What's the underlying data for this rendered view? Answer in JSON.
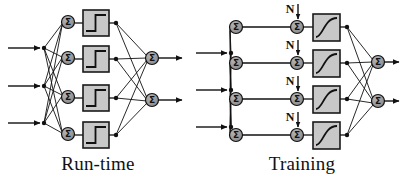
{
  "figure": {
    "background_color": "#ffffff",
    "stroke_color": "#111111",
    "node_fill_color": "#9a9a9a",
    "box_fill_color": "#c8c8c8",
    "box_border_color": "#1a1a1a"
  },
  "panels": [
    {
      "id": "run-time",
      "caption": "Run-time",
      "caption_x": 98,
      "caption_y": 170,
      "activation": "step",
      "has_noise_injection": false,
      "inputs": [
        {
          "label": "",
          "y": 48
        },
        {
          "label": "",
          "y": 86
        },
        {
          "label": "",
          "y": 123
        }
      ],
      "hidden_nodes": [
        {
          "symbol": "Σ",
          "x": 68,
          "y": 22
        },
        {
          "symbol": "Σ",
          "x": 68,
          "y": 58
        },
        {
          "symbol": "Σ",
          "x": 68,
          "y": 97
        },
        {
          "symbol": "Σ",
          "x": 68,
          "y": 134
        }
      ],
      "activation_boxes": [
        {
          "x": 83,
          "y": 10,
          "w": 26,
          "h": 26,
          "shape": "step"
        },
        {
          "x": 83,
          "y": 46,
          "w": 26,
          "h": 26,
          "shape": "step"
        },
        {
          "x": 83,
          "y": 85,
          "w": 26,
          "h": 26,
          "shape": "step"
        },
        {
          "x": 83,
          "y": 122,
          "w": 26,
          "h": 26,
          "shape": "step"
        }
      ],
      "output_nodes": [
        {
          "symbol": "Σ",
          "x": 152,
          "y": 58
        },
        {
          "symbol": "Σ",
          "x": 152,
          "y": 100
        }
      ],
      "noise_labels": []
    },
    {
      "id": "training",
      "caption": "Training",
      "caption_x": 302,
      "caption_y": 170,
      "activation": "sigmoid",
      "has_noise_injection": true,
      "inputs": [
        {
          "label": "",
          "y": 48
        },
        {
          "label": "",
          "y": 86
        },
        {
          "label": "",
          "y": 123
        }
      ],
      "hidden_nodes": [
        {
          "symbol": "Σ",
          "x": 236,
          "y": 27
        },
        {
          "symbol": "Σ",
          "x": 236,
          "y": 63
        },
        {
          "symbol": "Σ",
          "x": 236,
          "y": 99
        },
        {
          "symbol": "Σ",
          "x": 236,
          "y": 135
        }
      ],
      "noise_nodes": [
        {
          "symbol": "Σ",
          "x": 297,
          "y": 27
        },
        {
          "symbol": "Σ",
          "x": 297,
          "y": 63
        },
        {
          "symbol": "Σ",
          "x": 297,
          "y": 99
        },
        {
          "symbol": "Σ",
          "x": 297,
          "y": 135
        }
      ],
      "noise_labels": [
        {
          "text": "N",
          "x": 291,
          "y": 11,
          "arrow_x": 297,
          "arrow_y0": 12,
          "arrow_y1": 21
        },
        {
          "text": "N",
          "x": 291,
          "y": 47,
          "arrow_x": 297,
          "arrow_y0": 48,
          "arrow_y1": 57
        },
        {
          "text": "N",
          "x": 291,
          "y": 83,
          "arrow_x": 297,
          "arrow_y0": 84,
          "arrow_y1": 93
        },
        {
          "text": "N",
          "x": 291,
          "y": 119,
          "arrow_x": 297,
          "arrow_y0": 120,
          "arrow_y1": 129
        }
      ],
      "activation_boxes": [
        {
          "x": 313,
          "y": 14,
          "w": 27,
          "h": 27,
          "shape": "sigmoid"
        },
        {
          "x": 313,
          "y": 50,
          "w": 27,
          "h": 27,
          "shape": "sigmoid"
        },
        {
          "x": 313,
          "y": 86,
          "w": 27,
          "h": 27,
          "shape": "sigmoid"
        },
        {
          "x": 313,
          "y": 122,
          "w": 27,
          "h": 27,
          "shape": "sigmoid"
        }
      ],
      "output_nodes": [
        {
          "symbol": "Σ",
          "x": 378,
          "y": 62
        },
        {
          "symbol": "Σ",
          "x": 378,
          "y": 101
        }
      ]
    }
  ],
  "captions": {
    "left": "Run-time",
    "right": "Training"
  },
  "symbols": {
    "summation": "Σ",
    "noise": "N"
  }
}
